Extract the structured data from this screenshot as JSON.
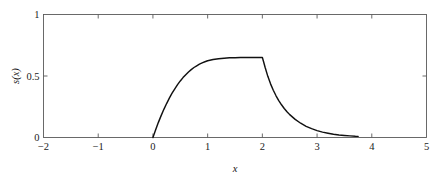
{
  "chart_data": {
    "type": "line",
    "title": "",
    "xlabel": "x",
    "ylabel": "s(x)",
    "xlim": [
      -2,
      5
    ],
    "ylim": [
      0,
      1
    ],
    "xticks": [
      -2,
      -1,
      0,
      1,
      2,
      3,
      4,
      5
    ],
    "xticklabels": [
      "−2",
      "−1",
      "0",
      "1",
      "2",
      "3",
      "4",
      "5"
    ],
    "yticks": [
      0,
      0.5,
      1
    ],
    "yticklabels": [
      "0",
      "0.5",
      "1"
    ],
    "grid": false,
    "legend": null,
    "box": true,
    "line_color": "#111111",
    "axis_color": "#5a5a5a",
    "background": "#ffffff",
    "series": [
      {
        "name": "s(x)",
        "x": [
          0.0,
          0.05,
          0.1,
          0.15,
          0.2,
          0.25,
          0.3,
          0.35,
          0.4,
          0.45,
          0.5,
          0.55,
          0.6,
          0.65,
          0.7,
          0.75,
          0.8,
          0.85,
          0.9,
          0.95,
          1.0,
          1.1,
          1.2,
          1.3,
          1.4,
          1.5,
          1.6,
          1.7,
          1.8,
          1.9,
          2.0,
          2.02,
          2.05,
          2.1,
          2.15,
          2.2,
          2.25,
          2.3,
          2.35,
          2.4,
          2.45,
          2.5,
          2.6,
          2.7,
          2.8,
          2.9,
          3.0,
          3.1,
          3.2,
          3.3,
          3.4,
          3.5,
          3.6,
          3.7,
          3.75
        ],
        "y": [
          0.0,
          0.063,
          0.123,
          0.178,
          0.229,
          0.276,
          0.32,
          0.36,
          0.396,
          0.43,
          0.46,
          0.487,
          0.511,
          0.533,
          0.552,
          0.569,
          0.583,
          0.596,
          0.607,
          0.616,
          0.624,
          0.634,
          0.641,
          0.645,
          0.648,
          0.649,
          0.65,
          0.65,
          0.65,
          0.65,
          0.65,
          0.62,
          0.571,
          0.497,
          0.436,
          0.384,
          0.339,
          0.3,
          0.266,
          0.236,
          0.21,
          0.186,
          0.147,
          0.116,
          0.091,
          0.072,
          0.056,
          0.044,
          0.035,
          0.027,
          0.021,
          0.017,
          0.013,
          0.01,
          0.009
        ]
      }
    ],
    "annotations": [
      {
        "text": "plateau value",
        "value": 0.65,
        "x_range": [
          1.8,
          2.0
        ]
      },
      {
        "text": "curve start",
        "x": 0.0,
        "y": 0.0
      },
      {
        "text": "curve end",
        "x": 3.75,
        "y": 0.009
      }
    ]
  },
  "figure": {
    "xlabel": "x",
    "ylabel": "s(x)"
  }
}
